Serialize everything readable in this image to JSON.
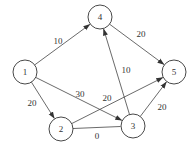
{
  "diagram": {
    "type": "directed-weighted-graph",
    "colors": {
      "stroke": "#333333",
      "edge": "#444444",
      "background": "#ffffff"
    },
    "node_radius": 12,
    "nodes": [
      {
        "id": "1",
        "label": "1",
        "x": 25,
        "y": 72
      },
      {
        "id": "2",
        "label": "2",
        "x": 61,
        "y": 129
      },
      {
        "id": "3",
        "label": "3",
        "x": 133,
        "y": 126
      },
      {
        "id": "4",
        "label": "4",
        "x": 100,
        "y": 17
      },
      {
        "id": "5",
        "label": "5",
        "x": 174,
        "y": 72
      }
    ],
    "edges": [
      {
        "from": "1",
        "to": "4",
        "weight": "10",
        "directed": true,
        "label_x": 58,
        "label_y": 41
      },
      {
        "from": "4",
        "to": "5",
        "weight": "20",
        "directed": true,
        "label_x": 141,
        "label_y": 34
      },
      {
        "from": "3",
        "to": "4",
        "weight": "10",
        "directed": true,
        "label_x": 126,
        "label_y": 70
      },
      {
        "from": "1",
        "to": "2",
        "weight": "20",
        "directed": true,
        "label_x": 32,
        "label_y": 103
      },
      {
        "from": "1",
        "to": "3",
        "weight": "30",
        "directed": true,
        "label_x": 80,
        "label_y": 94
      },
      {
        "from": "2",
        "to": "5",
        "weight": "20",
        "directed": true,
        "label_x": 107,
        "label_y": 98
      },
      {
        "from": "2",
        "to": "3",
        "weight": "0",
        "directed": false,
        "label_x": 97,
        "label_y": 136
      },
      {
        "from": "3",
        "to": "5",
        "weight": "20",
        "directed": true,
        "label_x": 162,
        "label_y": 107
      }
    ]
  }
}
